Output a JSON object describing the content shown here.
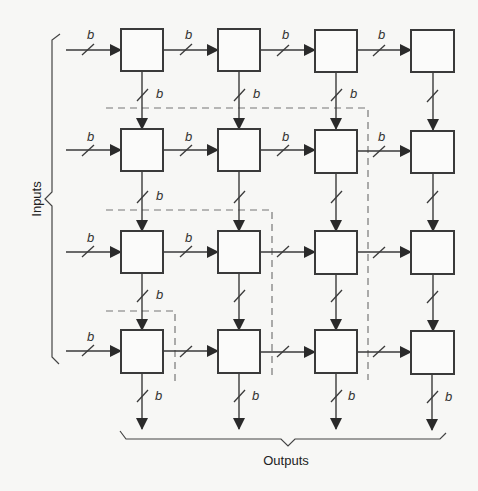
{
  "diagram": {
    "type": "systolic-array",
    "rows": 4,
    "cols": 4,
    "bus_width_label": "b",
    "inputs_label": "Inputs",
    "outputs_label": "Outputs",
    "colors": {
      "background": "#f7f7f5",
      "stroke": "#3a3a3a",
      "dashed": "#777777",
      "box_fill": "#fbfbfa"
    },
    "nodes": [
      {
        "id": "n11",
        "row": 1,
        "col": 1
      },
      {
        "id": "n12",
        "row": 1,
        "col": 2
      },
      {
        "id": "n13",
        "row": 1,
        "col": 3
      },
      {
        "id": "n14",
        "row": 1,
        "col": 4
      },
      {
        "id": "n21",
        "row": 2,
        "col": 1
      },
      {
        "id": "n22",
        "row": 2,
        "col": 2
      },
      {
        "id": "n23",
        "row": 2,
        "col": 3
      },
      {
        "id": "n24",
        "row": 2,
        "col": 4
      },
      {
        "id": "n31",
        "row": 3,
        "col": 1
      },
      {
        "id": "n32",
        "row": 3,
        "col": 2
      },
      {
        "id": "n33",
        "row": 3,
        "col": 3
      },
      {
        "id": "n34",
        "row": 3,
        "col": 4
      },
      {
        "id": "n41",
        "row": 4,
        "col": 1
      },
      {
        "id": "n42",
        "row": 4,
        "col": 2
      },
      {
        "id": "n43",
        "row": 4,
        "col": 3
      },
      {
        "id": "n44",
        "row": 4,
        "col": 4
      }
    ],
    "edges": {
      "horizontal_labeled": [
        "in1",
        "h11",
        "h12",
        "h13",
        "in2",
        "h21",
        "h22",
        "h23",
        "in3",
        "h31",
        "in4"
      ],
      "vertical_labeled": [
        "v11",
        "v12",
        "v13",
        "v21",
        "v31",
        "out1",
        "out2",
        "out3",
        "out4"
      ]
    },
    "dashed_boundaries": [
      {
        "name": "wavefront-1",
        "corner_row_col": [
          1,
          3
        ]
      },
      {
        "name": "wavefront-2",
        "corner_row_col": [
          2,
          2
        ]
      },
      {
        "name": "wavefront-3",
        "corner_row_col": [
          3,
          1
        ]
      }
    ]
  }
}
